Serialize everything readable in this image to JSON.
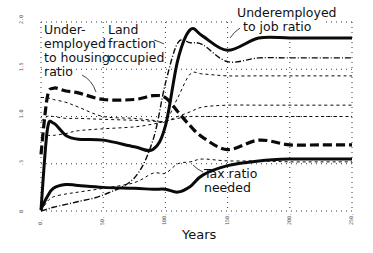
{
  "chart_data": {
    "type": "line",
    "title": "",
    "xlabel": "Years",
    "ylabel": "",
    "xlim": [
      0,
      250
    ],
    "ylim": [
      0,
      2.0
    ],
    "x_ticks": [
      "0",
      "50",
      "100",
      "150",
      "200",
      "250"
    ],
    "y_ticks": [
      "0",
      "0.5",
      "1.0",
      "1.5",
      "2.0"
    ],
    "grid": true,
    "legend": "inline annotations",
    "annotations": [
      {
        "text_lines": [
          "Under-",
          "employed",
          "to housing",
          "ratio"
        ],
        "x": 44,
        "y": 36
      },
      {
        "text_lines": [
          "Land",
          "fraction",
          "occupied"
        ],
        "x": 108,
        "y": 36
      },
      {
        "text_lines": [
          "Underemployed",
          "to job ratio"
        ],
        "x": 237,
        "y": 17
      },
      {
        "text_lines": [
          "Tax ratio",
          "needed"
        ],
        "x": 204,
        "y": 177
      }
    ],
    "x": [
      0,
      5,
      10,
      20,
      30,
      50,
      75,
      90,
      100,
      110,
      120,
      130,
      150,
      175,
      200,
      225,
      250
    ],
    "series": [
      {
        "name": "Underemployed to job ratio",
        "style": "solid-thick",
        "values": [
          0.01,
          0.85,
          0.93,
          0.8,
          0.76,
          0.75,
          0.68,
          0.65,
          0.9,
          1.6,
          1.92,
          1.85,
          1.7,
          1.83,
          1.83,
          1.83,
          1.83
        ]
      },
      {
        "name": "Underemployed to housing ratio",
        "style": "dash-thick",
        "values": [
          0.6,
          1.2,
          1.3,
          1.27,
          1.25,
          1.18,
          1.18,
          1.22,
          1.2,
          1.05,
          0.9,
          0.78,
          0.65,
          0.75,
          0.7,
          0.7,
          0.7
        ]
      },
      {
        "name": "Land fraction occupied",
        "style": "dash-dot-thin",
        "values": [
          0.0,
          0.02,
          0.04,
          0.07,
          0.1,
          0.17,
          0.35,
          0.75,
          1.35,
          1.78,
          1.78,
          1.76,
          1.58,
          1.62,
          1.62,
          1.62,
          1.62
        ]
      },
      {
        "name": "Tax ratio needed",
        "style": "solid-thick",
        "values": [
          0.02,
          0.15,
          0.24,
          0.28,
          0.27,
          0.25,
          0.24,
          0.23,
          0.23,
          0.2,
          0.26,
          0.38,
          0.48,
          0.53,
          0.55,
          0.55,
          0.55
        ]
      },
      {
        "name": "Auxiliary series A (dashed)",
        "style": "dash-thin",
        "values": [
          0.0,
          0.1,
          0.15,
          0.18,
          0.2,
          0.24,
          0.3,
          0.4,
          0.4,
          0.5,
          0.52,
          0.55,
          0.53,
          0.53,
          0.52,
          0.52,
          0.52
        ]
      },
      {
        "name": "Auxiliary series B (dashed)",
        "style": "dash-thin",
        "values": [
          0.95,
          1.0,
          1.0,
          0.98,
          0.98,
          0.97,
          0.96,
          0.95,
          0.95,
          1.0,
          1.05,
          1.1,
          1.12,
          1.12,
          1.12,
          1.12,
          1.12
        ]
      },
      {
        "name": "Auxiliary series C (dashed)",
        "style": "dash-thin",
        "values": [
          0.8,
          0.8,
          0.8,
          0.82,
          0.85,
          0.87,
          0.89,
          0.92,
          0.95,
          0.98,
          1.0,
          1.0,
          1.0,
          1.0,
          1.0,
          1.0,
          1.0
        ]
      },
      {
        "name": "Auxiliary series D (dashed)",
        "style": "dash-thin",
        "values": [
          1.2,
          1.2,
          1.18,
          1.15,
          1.1,
          1.0,
          0.98,
          0.96,
          0.95,
          1.2,
          1.45,
          1.45,
          1.43,
          1.43,
          1.43,
          1.43,
          1.43
        ]
      }
    ]
  },
  "axis": {
    "x_title": "Years",
    "x_ticks": [
      "0",
      "50",
      "100",
      "150",
      "200",
      "250"
    ],
    "y_ticks": [
      "2.0",
      "1.5",
      "1.0",
      ".5",
      "0"
    ]
  },
  "labels": {
    "housing": [
      "Under-",
      "employed",
      "to housing",
      "ratio"
    ],
    "land": [
      "Land",
      "fraction",
      "occupied"
    ],
    "job": [
      "Underemployed",
      "to job ratio"
    ],
    "tax": [
      "Tax ratio",
      "needed"
    ]
  }
}
